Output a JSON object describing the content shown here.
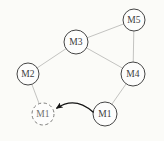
{
  "diagram": {
    "background": "#fbfbf8",
    "edge_color": "#bcbcba",
    "node_fill": "#fdfdfc",
    "node_stroke_color": "#454545",
    "dashed_node_stroke_color": "#7d7d7b",
    "label_color": "#3c3c3c",
    "dashed_label_color": "#6f6f6d",
    "arrow_color": "#141414",
    "nodes": [
      {
        "id": "M5",
        "label": "M5",
        "x": 134,
        "y": 20,
        "r": 11,
        "style": "solid"
      },
      {
        "id": "M3",
        "label": "M3",
        "x": 76,
        "y": 42,
        "r": 12,
        "style": "solid"
      },
      {
        "id": "M2",
        "label": "M2",
        "x": 28,
        "y": 74,
        "r": 11,
        "style": "solid"
      },
      {
        "id": "M4",
        "label": "M4",
        "x": 133,
        "y": 74,
        "r": 12,
        "style": "solid"
      },
      {
        "id": "M1-ghost",
        "label": "M1",
        "x": 43,
        "y": 114,
        "r": 11,
        "style": "dashed"
      },
      {
        "id": "M1-current",
        "label": "M1",
        "x": 105,
        "y": 114,
        "r": 12,
        "style": "solid"
      }
    ],
    "edges": [
      {
        "from": "M2",
        "to": "M3"
      },
      {
        "from": "M3",
        "to": "M5"
      },
      {
        "from": "M3",
        "to": "M4"
      },
      {
        "from": "M5",
        "to": "M4"
      },
      {
        "from": "M2",
        "to": "M1-ghost"
      },
      {
        "from": "M4",
        "to": "M1-current"
      }
    ],
    "move_arrow": {
      "from": "M1-current",
      "to": "M1-ghost",
      "path": "M 93 112 Q 75 96 57 108"
    }
  }
}
